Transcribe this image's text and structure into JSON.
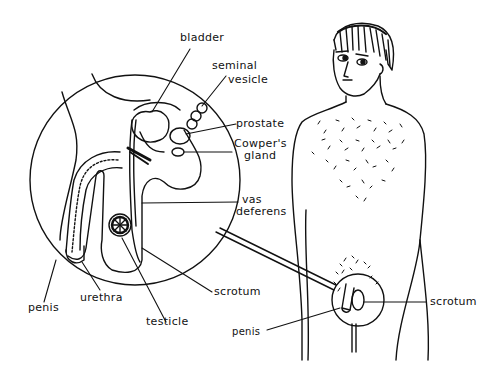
{
  "diagram": {
    "type": "anatomical illustration",
    "inset_labels": {
      "bladder": "bladder",
      "seminal_vesicle_line1": "seminal",
      "seminal_vesicle_line2": "vesicle",
      "prostate": "prostate",
      "cowpers_gland_line1": "Cowper's",
      "cowpers_gland_line2": "gland",
      "vas_deferens_line1": "vas",
      "vas_deferens_line2": "deferens",
      "scrotum": "scrotum",
      "testicle": "testicle",
      "urethra": "urethra",
      "penis": "penis"
    },
    "figure_labels": {
      "scrotum": "scrotum",
      "penis": "penis"
    },
    "colors": {
      "ink": "#111111",
      "background": "#ffffff"
    }
  }
}
